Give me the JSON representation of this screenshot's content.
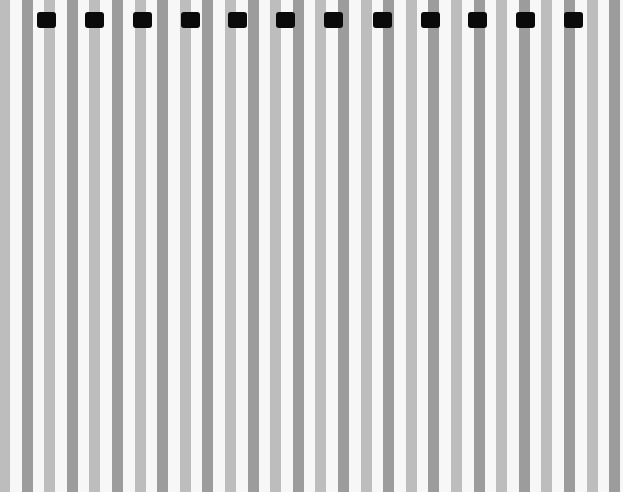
{
  "pattern": {
    "background": "#f7f7f7",
    "stripe_width": 11,
    "stripe_pitch": 22.6,
    "stripe_start": -1,
    "stripe_colors": [
      "#bdbdbd",
      "#9c9c9c"
    ]
  },
  "markers": {
    "count": 12,
    "color": "#0a0a0a",
    "x": [
      37,
      85,
      133,
      181,
      228,
      276,
      324,
      373,
      421,
      468,
      516,
      564
    ],
    "y": 12,
    "width": 19,
    "height": 16
  }
}
